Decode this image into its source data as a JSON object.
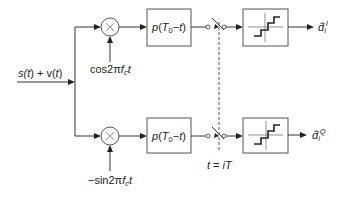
{
  "diagram": {
    "input_signal": {
      "prefix": "s(",
      "t1": "t",
      "mid": ") + v(",
      "t2": "t",
      "suffix": ")"
    },
    "branches": [
      {
        "id": "in-phase",
        "multiplier_symbol": "×",
        "carrier": {
          "func": "cos2π",
          "f": "f",
          "f_sub": "c",
          "t": "t"
        },
        "filter": {
          "p": "p",
          "open": "(",
          "T": "T",
          "T_sub": "0",
          "minus": "−",
          "t": "t",
          "close": ")"
        },
        "output": {
          "symbol": "d̂",
          "sub": "i",
          "sup": "I"
        }
      },
      {
        "id": "quadrature",
        "multiplier_symbol": "×",
        "carrier": {
          "func": "−sin2π",
          "f": "f",
          "f_sub": "c",
          "t": "t"
        },
        "filter": {
          "p": "p",
          "open": "(",
          "T": "T",
          "T_sub": "0",
          "minus": "−",
          "t": "t",
          "close": ")"
        },
        "output": {
          "symbol": "d̂",
          "sub": "i",
          "sup": "Q"
        }
      }
    ],
    "sampling": {
      "t": "t",
      "eq": " = ",
      "i": "i",
      "T": "T"
    },
    "icons": {
      "multiplier": "multiplier-icon",
      "sampler": "sampling-switch-icon",
      "decision": "staircase-quantizer-icon"
    }
  }
}
